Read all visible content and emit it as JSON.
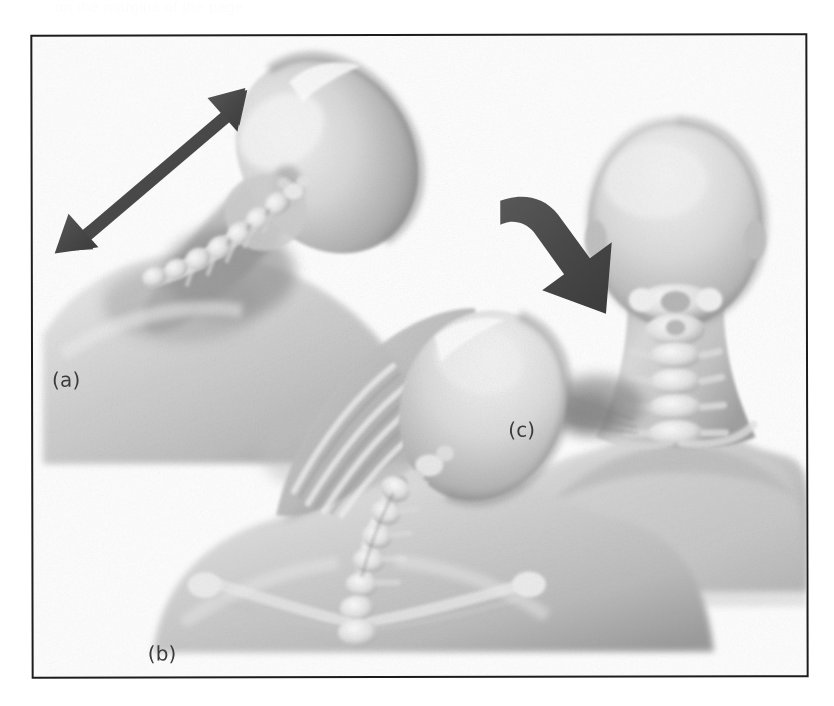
{
  "page": {
    "background_color": "#ffffff",
    "width": 834,
    "height": 706,
    "ghost_text": "on the margins of the page"
  },
  "figure": {
    "frame": {
      "border_color": "#1c1c1c",
      "border_width_px": 2,
      "x": 31,
      "y": 34,
      "width": 777,
      "height": 644,
      "background_color": "#ffffff"
    },
    "rendering_style": "grayscale airbrush medical illustration",
    "panels": [
      {
        "id": "a",
        "label": "(a)",
        "label_x": 19,
        "label_y": 331,
        "view": "lateral-oblique head tilted with cervical vertebrae visible",
        "annotation": "double-headed diagonal arrow indicating side-to-side lateral flexion range of motion"
      },
      {
        "id": "b",
        "label": "(b)",
        "label_x": 114,
        "label_y": 605,
        "view": "posterior view, head laterally flexed, cervical spine, clavicles and scapulae visible",
        "annotation": "none"
      },
      {
        "id": "c",
        "label": "(c)",
        "label_x": 475,
        "label_y": 382,
        "view": "posterior view of head, neck and shoulders with cervical spine visible",
        "annotation": "thick solid block arrow pointing down-right at the left base of the neck indicating the point of applied force"
      }
    ],
    "arrows": [
      {
        "id": "lateral-flexion-arrow",
        "panel": "a",
        "type": "double-headed",
        "color": "#4a4a4a",
        "from_x": 24,
        "from_y": 216,
        "to_x": 210,
        "to_y": 57
      },
      {
        "id": "force-arrow",
        "panel": "c",
        "type": "block-arrow-single-head",
        "color": "#4a4a4a",
        "from_x": 185,
        "from_y": 185,
        "to_x": 237,
        "to_y": 275
      }
    ],
    "colors": {
      "skin_light": "#f1f1f1",
      "skin_mid": "#c9c9c9",
      "skin_shadow": "#9a9a9a",
      "bone_highlight": "#fafafa",
      "bone_mid": "#d8d8d8",
      "outline_dark": "#6b6b6b",
      "arrow": "#4a4a4a",
      "label_text": "#3b3b3b"
    }
  }
}
